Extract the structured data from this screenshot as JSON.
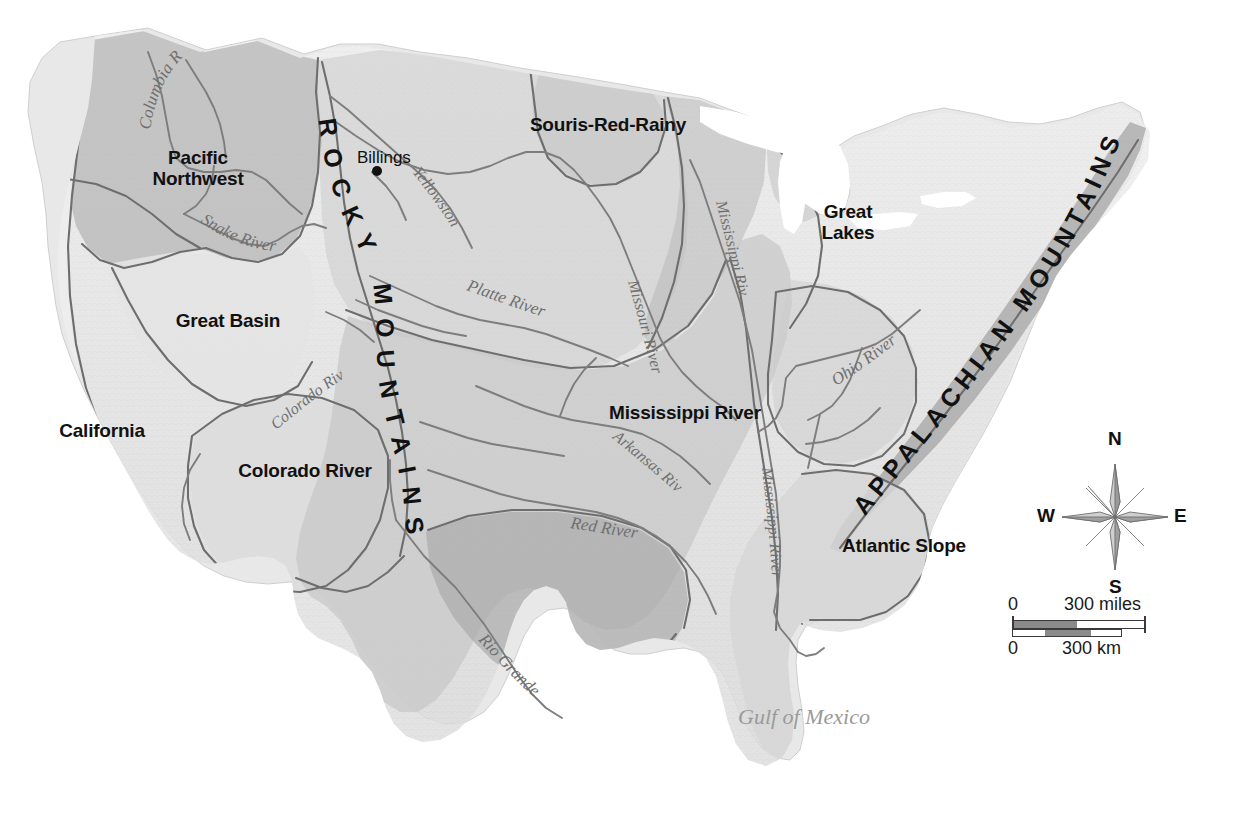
{
  "map": {
    "title": "United States Water Resource Regions and Major Rivers",
    "background_color": "#ffffff",
    "land_base_color": "#e6e6e6",
    "region_fill_light": "#dcdcdc",
    "region_fill_mid": "#c9c9c9",
    "region_fill_dark": "#b0b0b0",
    "region_fill_darkest": "#9c9c9c",
    "boundary_color": "#6e6e6e",
    "river_color": "#7d7d7d",
    "label_color": "#111111",
    "water_label_color": "#9a9a9a"
  },
  "regions": [
    {
      "name": "pacific-northwest",
      "label": "Pacific\nNorthwest",
      "x": 118,
      "y": 147,
      "width": 160
    },
    {
      "name": "great-basin",
      "label": "Great Basin",
      "x": 148,
      "y": 310,
      "width": 160
    },
    {
      "name": "california",
      "label": "California",
      "x": 32,
      "y": 420,
      "width": 140
    },
    {
      "name": "colorado-river",
      "label": "Colorado River",
      "x": 215,
      "y": 460,
      "width": 180
    },
    {
      "name": "souris-red-rainy",
      "label": "Souris-Red-Rainy",
      "x": 518,
      "y": 114,
      "width": 180
    },
    {
      "name": "great-lakes",
      "label": "Great\nLakes",
      "x": 800,
      "y": 201,
      "width": 96
    },
    {
      "name": "mississippi-river",
      "label": "Mississippi River",
      "x": 597,
      "y": 402,
      "width": 172
    },
    {
      "name": "atlantic-slope",
      "label": "Atlantic Slope",
      "x": 822,
      "y": 535,
      "width": 160
    }
  ],
  "mountain_ranges": [
    {
      "name": "rocky-mountains",
      "label": "ROCKY MOUNTAINS",
      "letters": [
        "R",
        "O",
        "C",
        "K",
        "Y",
        "M",
        "O",
        "U",
        "N",
        "T",
        "A",
        "I",
        "N",
        "S"
      ]
    },
    {
      "name": "appalachian-mountains",
      "label": "APPALACHIAN MOUNTAINS",
      "letters": [
        "A",
        "P",
        "P",
        "A",
        "L",
        "A",
        "C",
        "H",
        "I",
        "A",
        "N",
        "M",
        "O",
        "U",
        "N",
        "T",
        "A",
        "I",
        "N",
        "S"
      ]
    }
  ],
  "rivers": [
    {
      "name": "columbia-river",
      "label": "Columbia River"
    },
    {
      "name": "snake-river",
      "label": "Snake River"
    },
    {
      "name": "yellowstone-river",
      "label": "Yellowstone River"
    },
    {
      "name": "platte-river",
      "label": "Platte River"
    },
    {
      "name": "missouri-river",
      "label": "Missouri River"
    },
    {
      "name": "mississippi-river-upper",
      "label": "Mississippi River"
    },
    {
      "name": "mississippi-river-lower",
      "label": "Mississippi River"
    },
    {
      "name": "ohio-river",
      "label": "Ohio River"
    },
    {
      "name": "arkansas-river",
      "label": "Arkansas River"
    },
    {
      "name": "red-river",
      "label": "Red River"
    },
    {
      "name": "rio-grande",
      "label": "Rio Grande"
    },
    {
      "name": "colorado-river-stream",
      "label": "Colorado River"
    }
  ],
  "cities": [
    {
      "name": "billings",
      "label": "Billings",
      "label_x": 357,
      "label_y": 148,
      "dot_x": 377,
      "dot_y": 171
    }
  ],
  "water_bodies": [
    {
      "name": "gulf-of-mexico",
      "label": "Gulf of Mexico",
      "x": 738,
      "y": 704
    }
  ],
  "compass": {
    "center_x": 1115,
    "center_y": 517,
    "north": "N",
    "east": "E",
    "south": "S",
    "west": "W",
    "rose_fill_light": "#cfcfcf",
    "rose_fill_dark": "#8f8f8f"
  },
  "scale": {
    "miles_zero": "0",
    "miles_max": "300 miles",
    "km_zero": "0",
    "km_max": "300 km"
  }
}
